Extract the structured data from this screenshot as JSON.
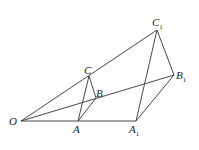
{
  "diagram": {
    "points": {
      "O": {
        "label": "O",
        "x": 21,
        "y": 121
      },
      "A": {
        "label": "A",
        "x": 78,
        "y": 121
      },
      "A1": {
        "label": "A",
        "sub": "1",
        "x": 136,
        "y": 121
      },
      "B": {
        "label": "B",
        "x": 96,
        "y": 98
      },
      "B1": {
        "label": "B",
        "sub": "1",
        "x": 174,
        "y": 75
      },
      "C": {
        "label": "C",
        "x": 89,
        "y": 76
      },
      "C1": {
        "label": "C",
        "sub": "1",
        "x": 157,
        "y": 30
      }
    },
    "segments": [
      [
        "O",
        "C1"
      ],
      [
        "O",
        "B1"
      ],
      [
        "O",
        "A1"
      ],
      [
        "C",
        "A"
      ],
      [
        "C",
        "B"
      ],
      [
        "B",
        "A"
      ],
      [
        "C1",
        "A1"
      ],
      [
        "C1",
        "B1"
      ],
      [
        "B1",
        "A1"
      ]
    ]
  }
}
